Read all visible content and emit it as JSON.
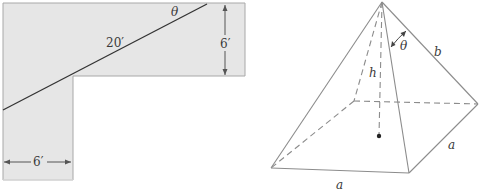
{
  "figure_left": {
    "description": "Ladder carried around an L-shaped corner",
    "colors": {
      "fill": "#e6e6e6",
      "stroke": "#9a9a9a",
      "line": "#333333"
    },
    "labels": {
      "angle": "θ",
      "ladder_length": "20′",
      "corridor_height": "6′",
      "corridor_width": "6′"
    }
  },
  "figure_right": {
    "description": "Square pyramid with height h, slant edge b, base side a",
    "colors": {
      "edge": "#8c8c8c",
      "dashed": "#8c8c8c",
      "point": "#222222"
    },
    "labels": {
      "angle": "θ",
      "slant_edge": "b",
      "height": "h",
      "base_side_right": "a",
      "base_side_front": "a"
    }
  }
}
